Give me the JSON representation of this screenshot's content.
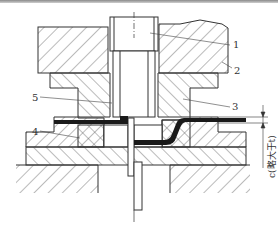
{
  "diagram": {
    "type": "die cross-section (bending/drawing die)",
    "colors": {
      "line": "#333333",
      "hatch": "#555555",
      "workpiece": "#1a1a1a",
      "background": "#ffffff"
    },
    "part_labels": [
      {
        "id": "1",
        "text": "1"
      },
      {
        "id": "2",
        "text": "2"
      },
      {
        "id": "3",
        "text": "3"
      },
      {
        "id": "4",
        "text": "4"
      },
      {
        "id": "5",
        "text": "5"
      }
    ],
    "dimension": {
      "symbol": "c",
      "note": "c(略大于t)"
    }
  }
}
